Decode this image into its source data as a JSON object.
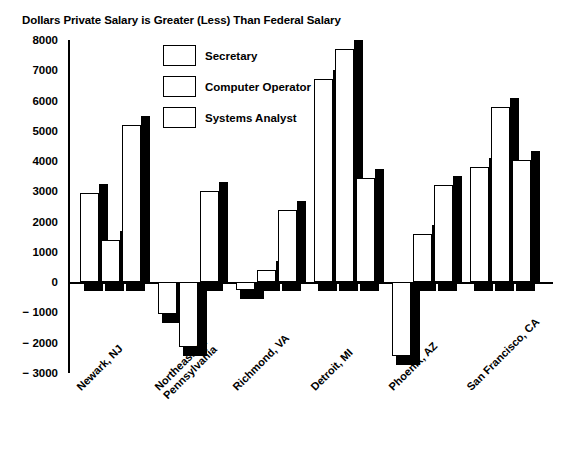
{
  "chart_data": {
    "type": "bar",
    "title": "Dollars Private Salary is Greater (Less) Than Federal Salary",
    "xlabel": "",
    "ylabel": "",
    "ylim": [
      -3000,
      8000
    ],
    "ytick_step": 1000,
    "yticks": [
      "8000",
      "7000",
      "6000",
      "5000",
      "4000",
      "3000",
      "2000",
      "1000",
      "0",
      "− 1000",
      "− 2000",
      "− 3000"
    ],
    "ytick_values": [
      8000,
      7000,
      6000,
      5000,
      4000,
      3000,
      2000,
      1000,
      0,
      -1000,
      -2000,
      -3000
    ],
    "grid": false,
    "legend_position": "upper-center-left",
    "categories": [
      "Newark, NJ",
      "Northeastern Pennsylvania",
      "Richmond, VA",
      "Detroit, MI",
      "Phoenix, AZ",
      "San Francisco, CA"
    ],
    "category_lines": [
      [
        "Newark, NJ"
      ],
      [
        "Northeastern",
        "Pennsylvania"
      ],
      [
        "Richmond, VA"
      ],
      [
        "Detroit, MI"
      ],
      [
        "Phoenix, AZ"
      ],
      [
        "San Francisco, CA"
      ]
    ],
    "series": [
      {
        "name": "Secretary",
        "values": [
          2950,
          -1050,
          -250,
          6700,
          -2450,
          3800
        ]
      },
      {
        "name": "Computer Operator",
        "values": [
          1400,
          -2150,
          400,
          7700,
          1600,
          5800
        ]
      },
      {
        "name": "Systems Analyst",
        "values": [
          5200,
          3000,
          2400,
          3450,
          3200,
          4050
        ]
      }
    ],
    "colors": {
      "bar_fill": "#ffffff",
      "bar_outline": "#000000",
      "bar_shadow": "#000000",
      "axis": "#000000",
      "background": "#ffffff"
    }
  },
  "legend": {
    "items": [
      {
        "label": "Secretary"
      },
      {
        "label": "Computer Operator"
      },
      {
        "label": "Systems Analyst"
      }
    ]
  }
}
